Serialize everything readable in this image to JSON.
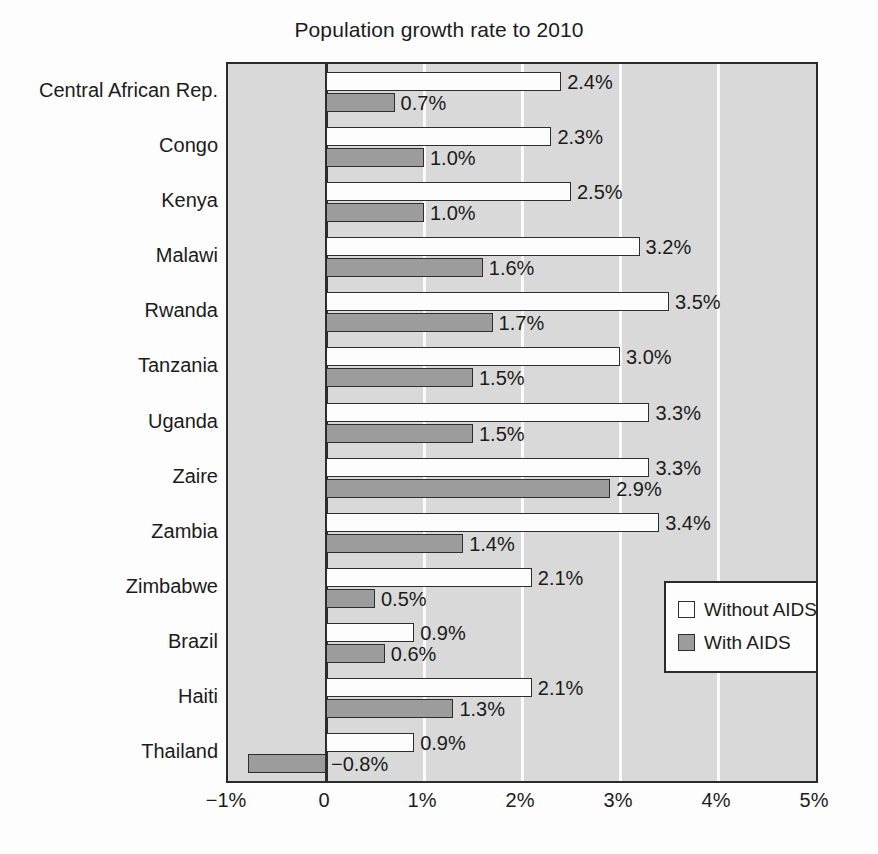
{
  "chart_data": {
    "type": "bar",
    "orientation": "horizontal",
    "title": "Population growth rate to 2010",
    "xlabel": "",
    "ylabel": "",
    "xlim": [
      -1,
      5
    ],
    "xticks": [
      -1,
      0,
      1,
      2,
      3,
      4,
      5
    ],
    "xtick_labels": [
      "−1%",
      "0",
      "1%",
      "2%",
      "3%",
      "4%",
      "5%"
    ],
    "grid": true,
    "grid_axis": "x",
    "legend_position": "lower right",
    "categories": [
      "Central African Rep.",
      "Congo",
      "Kenya",
      "Malawi",
      "Rwanda",
      "Tanzania",
      "Uganda",
      "Zaire",
      "Zambia",
      "Zimbabwe",
      "Brazil",
      "Haiti",
      "Thailand"
    ],
    "series": [
      {
        "name": "Without AIDS",
        "color": "#fdfdfd",
        "values": [
          2.4,
          2.3,
          2.5,
          3.2,
          3.5,
          3.0,
          3.3,
          3.3,
          3.4,
          2.1,
          0.9,
          2.1,
          0.9
        ],
        "labels": [
          "2.4%",
          "2.3%",
          "2.5%",
          "3.2%",
          "3.5%",
          "3.0%",
          "3.3%",
          "3.3%",
          "3.4%",
          "2.1%",
          "0.9%",
          "2.1%",
          "0.9%"
        ]
      },
      {
        "name": "With AIDS",
        "color": "#9c9c9c",
        "values": [
          0.7,
          1.0,
          1.0,
          1.6,
          1.7,
          1.5,
          1.5,
          2.9,
          1.4,
          0.5,
          0.6,
          1.3,
          -0.8
        ],
        "labels": [
          "0.7%",
          "1.0%",
          "1.0%",
          "1.6%",
          "1.7%",
          "1.5%",
          "1.5%",
          "2.9%",
          "1.4%",
          "0.5%",
          "0.6%",
          "1.3%",
          "−0.8%"
        ]
      }
    ]
  },
  "legend": {
    "entries": [
      {
        "label": "Without AIDS"
      },
      {
        "label": "With AIDS"
      }
    ]
  }
}
